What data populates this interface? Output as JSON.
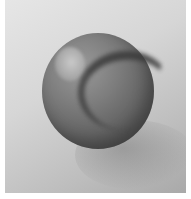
{
  "image": {
    "subject": "glossy sphere (marble) on a plain surface",
    "colors": {
      "border": "#ffffff",
      "background_light": "#e6e6e6",
      "background_dark": "#a9a9a9",
      "sphere_mid": "#7c7c7c",
      "sphere_dark": "#4a4a4a",
      "band": "#3a3a3a",
      "highlight": "#c9c9c9"
    }
  }
}
